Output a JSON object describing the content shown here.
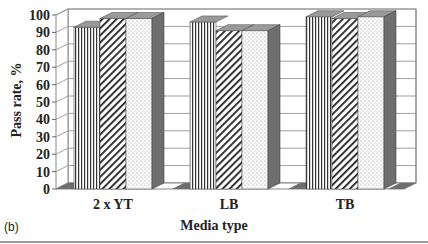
{
  "chart_data": {
    "type": "bar",
    "style": "3d-clustered-column",
    "title": "",
    "panel_label": "(b)",
    "xlabel": "Media type",
    "ylabel": "Pass rate, %",
    "categories": [
      "2 x YT",
      "LB",
      "TB"
    ],
    "series": [
      {
        "name": "Series 1 (vertical stripes)",
        "pattern": "vertical-lines",
        "values": [
          93,
          96,
          99
        ]
      },
      {
        "name": "Series 2 (diagonal hatch)",
        "pattern": "diagonal-hatch",
        "values": [
          98,
          91,
          98
        ]
      },
      {
        "name": "Series 3 (dotted)",
        "pattern": "dots",
        "values": [
          98,
          91,
          99
        ]
      }
    ],
    "ylim": [
      0,
      100
    ],
    "yticks": [
      0,
      10,
      20,
      30,
      40,
      50,
      60,
      70,
      80,
      90,
      100
    ],
    "grid": true,
    "legend": "none"
  },
  "colors": {
    "side": "#6e6e6e",
    "top": "#9a9a9a",
    "floor": "#6e6e6e",
    "grid": "#a0a0a0",
    "ink": "#222222"
  }
}
